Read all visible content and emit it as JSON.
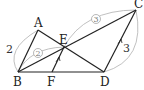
{
  "diagram": {
    "points": {
      "A": {
        "label": "A",
        "x": 38,
        "y": 30
      },
      "B": {
        "label": "B",
        "x": 18,
        "y": 72
      },
      "C": {
        "label": "C",
        "x": 136,
        "y": 10
      },
      "D": {
        "label": "D",
        "x": 104,
        "y": 72
      },
      "E": {
        "label": "E",
        "x": 64,
        "y": 47
      },
      "F": {
        "label": "F",
        "x": 52,
        "y": 72
      }
    },
    "segments": [
      "AB",
      "AD",
      "BC",
      "BD",
      "CD",
      "EF"
    ],
    "length_labels": {
      "AB": "2",
      "CD": "3",
      "BE": "2",
      "EC": "3"
    },
    "parallel_marks": [
      "EF",
      "CD"
    ],
    "colors": {
      "line": "#222222",
      "arc": "#aaaaaa"
    }
  }
}
